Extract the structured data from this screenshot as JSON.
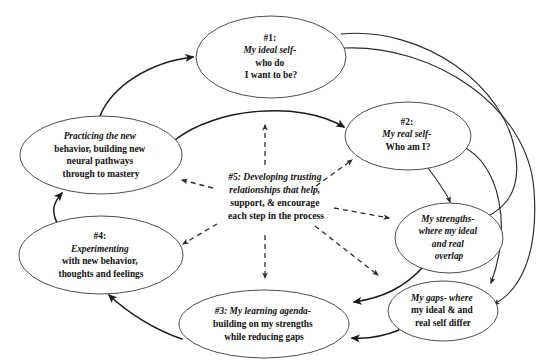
{
  "diagram": {
    "background_color": "#ffffff",
    "node_stroke_color": "#3a3a3a",
    "edge_color": "#1a1a1a",
    "dashed_edge_color": "#2b2b2b",
    "nodes": [
      {
        "id": "ideal-self",
        "label": "#1: My ideal self- who do I want to be?",
        "lines": [
          {
            "text": "#1:",
            "style": "bold"
          },
          {
            "text": "My ideal self-",
            "style": "italic"
          },
          {
            "text": "who do",
            "style": "bold"
          },
          {
            "text": "I want to be?",
            "style": "bold"
          }
        ],
        "cx": 271,
        "cy": 57,
        "rx": 75,
        "ry": 41
      },
      {
        "id": "real-self",
        "label": "#2: My real self- Who am I?",
        "lines": [
          {
            "text": "#2:",
            "style": "bold"
          },
          {
            "text": "My real self-",
            "style": "italic"
          },
          {
            "text": "Who am I?",
            "style": "bold"
          }
        ],
        "cx": 408,
        "cy": 136,
        "rx": 63,
        "ry": 34
      },
      {
        "id": "my-strengths",
        "label": "My strengths- where my ideal and real overlap",
        "lines": [
          {
            "text": "My strengths-",
            "style": "italic"
          },
          {
            "text": "where my ideal",
            "style": "italic"
          },
          {
            "text": "and real",
            "style": "italic"
          },
          {
            "text": "overlap",
            "style": "italic"
          }
        ],
        "cx": 449,
        "cy": 238,
        "rx": 54,
        "ry": 35
      },
      {
        "id": "my-gaps",
        "label": "My gaps- where my ideal & and real self differ",
        "lines": [
          {
            "text": "My gaps- where",
            "style": "mixed-italic-lead"
          },
          {
            "text": "my ideal  & and",
            "style": "bold"
          },
          {
            "text": "real self differ",
            "style": "bold"
          }
        ],
        "cx": 443,
        "cy": 311,
        "rx": 55,
        "ry": 30
      },
      {
        "id": "learning-agenda",
        "label": "#3: My learning agenda- building on my strengths while reducing gaps",
        "lines": [
          {
            "text": "#3: My learning agenda-",
            "style": "mixed-italic-tail"
          },
          {
            "text": "building on my strengths",
            "style": "bold"
          },
          {
            "text": "while reducing gaps",
            "style": "bold"
          }
        ],
        "cx": 264,
        "cy": 324,
        "rx": 85,
        "ry": 34
      },
      {
        "id": "experimenting",
        "label": "#4: Experimenting with new behavior, thoughts and feelings",
        "lines": [
          {
            "text": "#4:",
            "style": "bold"
          },
          {
            "text": "Experimenting",
            "style": "italic"
          },
          {
            "text": "with new behavior,",
            "style": "bold"
          },
          {
            "text": "thoughts and feelings",
            "style": "bold"
          }
        ],
        "cx": 101,
        "cy": 255,
        "rx": 82,
        "ry": 39
      },
      {
        "id": "practicing",
        "label": "Practicing the new behavior, building new neural pathways through to mastery",
        "lines": [
          {
            "text": "Practicing the new",
            "style": "mixed-italic-lead"
          },
          {
            "text": "behavior, building new",
            "style": "bold"
          },
          {
            "text": "neural pathways",
            "style": "bold"
          },
          {
            "text": "through to mastery",
            "style": "bold"
          }
        ],
        "cx": 101,
        "cy": 155,
        "rx": 81,
        "ry": 39
      }
    ],
    "center_note": {
      "id": "trusting-relationships",
      "label": "#5: Developing trusting relationships that help, support, & encourage each step in the process",
      "lines": [
        {
          "text": "#5: Developing trusting",
          "style": "mixed-italic-tail"
        },
        {
          "text": "relationships that help,",
          "style": "mixed-italic-lead"
        },
        {
          "text": "support, & encourage",
          "style": "bold"
        },
        {
          "text": "each step in the process",
          "style": "bold"
        }
      ],
      "cx": 276,
      "cy": 196
    },
    "edges": [
      {
        "id": "practicing-to-ideal-self",
        "from": "practicing",
        "to": "ideal-self",
        "style": "solid",
        "arrow": true
      },
      {
        "id": "practicing-to-real-self",
        "from": "practicing",
        "to": "real-self",
        "style": "solid",
        "arrow": true
      },
      {
        "id": "ideal-self-to-strengths",
        "from": "ideal-self",
        "to": "my-strengths",
        "style": "solid",
        "arrow": true
      },
      {
        "id": "ideal-self-to-gaps",
        "from": "ideal-self",
        "to": "my-gaps",
        "style": "solid",
        "arrow": true
      },
      {
        "id": "real-self-to-strengths",
        "from": "real-self",
        "to": "my-strengths",
        "style": "solid",
        "arrow": true
      },
      {
        "id": "real-self-to-gaps",
        "from": "real-self",
        "to": "my-gaps",
        "style": "solid",
        "arrow": true
      },
      {
        "id": "strengths-to-learning-agenda",
        "from": "my-strengths",
        "to": "learning-agenda",
        "style": "solid",
        "arrow": true
      },
      {
        "id": "gaps-to-learning-agenda",
        "from": "my-gaps",
        "to": "learning-agenda",
        "style": "solid",
        "arrow": true
      },
      {
        "id": "learning-agenda-to-experimenting",
        "from": "learning-agenda",
        "to": "experimenting",
        "style": "solid",
        "arrow": true
      },
      {
        "id": "experimenting-to-practicing",
        "from": "experimenting",
        "to": "practicing",
        "style": "solid",
        "arrow": true
      },
      {
        "id": "note-to-ideal-self",
        "from": "trusting-relationships",
        "to": "ideal-self",
        "style": "dashed",
        "arrow": true
      },
      {
        "id": "note-to-real-self",
        "from": "trusting-relationships",
        "to": "real-self",
        "style": "dashed",
        "arrow": true
      },
      {
        "id": "note-to-strengths",
        "from": "trusting-relationships",
        "to": "my-strengths",
        "style": "dashed",
        "arrow": true
      },
      {
        "id": "note-to-learning-agenda",
        "from": "trusting-relationships",
        "to": "learning-agenda",
        "style": "dashed",
        "arrow": true
      },
      {
        "id": "note-to-experimenting",
        "from": "trusting-relationships",
        "to": "experimenting",
        "style": "dashed",
        "arrow": true
      },
      {
        "id": "note-to-practicing",
        "from": "trusting-relationships",
        "to": "practicing",
        "style": "dashed",
        "arrow": true
      }
    ]
  }
}
